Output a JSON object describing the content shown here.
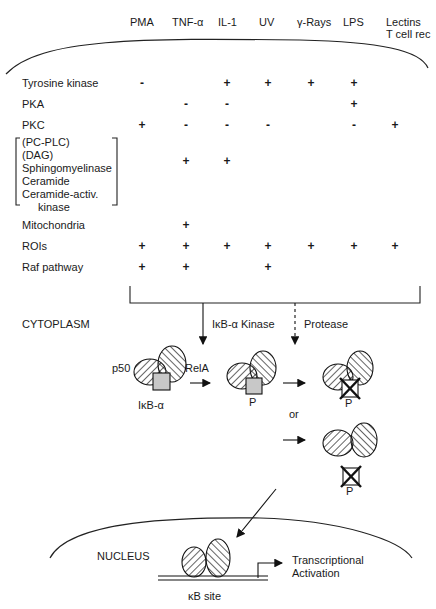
{
  "diagram": {
    "title": "",
    "stimuli": [
      {
        "id": "pma",
        "label": "PMA",
        "x": 130
      },
      {
        "id": "tnf",
        "label": "TNF-α",
        "x": 172
      },
      {
        "id": "il1",
        "label": "IL-1",
        "x": 218
      },
      {
        "id": "uv",
        "label": "UV",
        "x": 259
      },
      {
        "id": "gamma",
        "label": "γ-Rays",
        "x": 297
      },
      {
        "id": "lps",
        "label": "LPS",
        "x": 343
      },
      {
        "id": "lectins",
        "label": "Lectins",
        "label2": "T cell rec",
        "x": 385
      }
    ],
    "rows": [
      {
        "label": "Tyrosine kinase",
        "values": [
          "-",
          "",
          "+",
          "+",
          "+",
          "+",
          ""
        ]
      },
      {
        "label": "PKA",
        "values": [
          "",
          "-",
          "-",
          "",
          "",
          "+",
          ""
        ]
      },
      {
        "label": "PKC",
        "values": [
          "+",
          "-",
          "-",
          "-",
          "",
          "-",
          "+"
        ]
      },
      {
        "label_lines": [
          "(PC-PLC)",
          "(DAG)",
          "Sphingomyelinase",
          "Ceramide",
          "Ceramide-activ.",
          "kinase"
        ],
        "values": [
          "",
          "+",
          "+",
          "",
          "",
          "",
          ""
        ]
      },
      {
        "label": "Mitochondria",
        "values": [
          "",
          "+",
          "",
          "",
          "",
          "",
          ""
        ]
      },
      {
        "label": "ROIs",
        "values": [
          "+",
          "+",
          "+",
          "+",
          "+",
          "+",
          "+"
        ]
      },
      {
        "label": "Raf pathway",
        "values": [
          "+",
          "+",
          "",
          "+",
          "",
          "",
          ""
        ]
      }
    ],
    "compartments": {
      "cytoplasm": "CYTOPLASM",
      "nucleus": "NUCLEUS"
    },
    "pathways": {
      "kinase": "IκB-α Kinase",
      "protease": "Protease"
    },
    "complex_labels": {
      "p50": "p50",
      "rela": "RelA",
      "ikba": "IκB-α",
      "phospho1": "P",
      "phospho2": "P",
      "phospho3": "P",
      "or": "or"
    },
    "nucleus_labels": {
      "kb_site": "κB site",
      "transcription_line1": "Transcriptional",
      "transcription_line2": "Activation"
    }
  }
}
